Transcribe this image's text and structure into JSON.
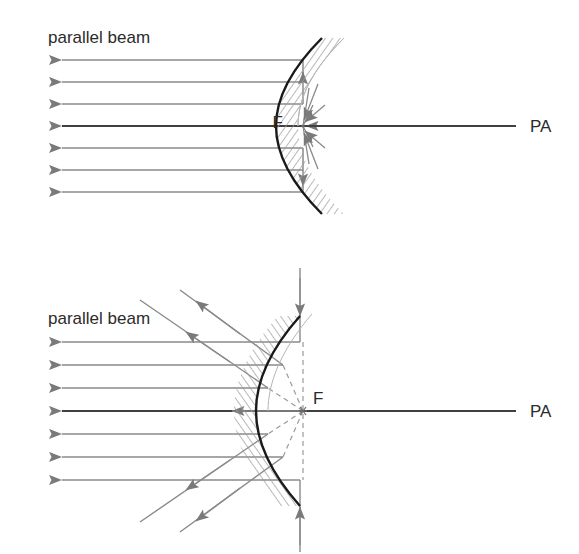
{
  "figure": {
    "background_color": "#ffffff",
    "width": 579,
    "height": 554
  },
  "colors": {
    "ray": "#8a8a8a",
    "arrowhead": "#7a7a7a",
    "axis": "#404040",
    "mirror": "#1a1a1a",
    "hatch": "#9a9a9a",
    "dashed": "#9a9a9a",
    "text": "#2b2b2b"
  },
  "diagrams": [
    {
      "id": "concave-mirror",
      "mirror_type": "concave",
      "beam_label": "parallel beam",
      "focus_label": "F",
      "axis_label": "PA",
      "focus_type": "real",
      "ray_count": 7,
      "ray_y_positions": [
        60,
        82,
        104,
        126,
        148,
        170,
        192
      ],
      "axis_y": 126,
      "focus_x": 303,
      "focus_y": 126,
      "vertex_x": 322,
      "beam_label_x": 48,
      "beam_label_y": 43,
      "focus_label_x": 283,
      "focus_label_y": 128,
      "axis_label_x": 530,
      "axis_label_y": 132,
      "axis_x_start": 28,
      "axis_x_end": 516,
      "ray_x_start": 62,
      "ray_x_end": 303,
      "hatch_side": "right",
      "description": "Parallel rays travelling leftward strike a concave mirror and converge on the real focal point F in front of the mirror."
    },
    {
      "id": "convex-mirror",
      "mirror_type": "convex",
      "beam_label": "parallel beam",
      "focus_label": "F",
      "axis_label": "PA",
      "focus_type": "virtual",
      "ray_count": 7,
      "ray_y_positions": [
        342,
        365,
        388,
        411,
        434,
        457,
        480
      ],
      "axis_y": 411,
      "focus_x": 303,
      "focus_y": 411,
      "vertex_x": 262,
      "beam_label_x": 48,
      "beam_label_y": 324,
      "focus_label_x": 313,
      "focus_label_y": 404,
      "axis_label_x": 530,
      "axis_label_y": 417,
      "axis_x_start": 28,
      "axis_x_end": 516,
      "ray_x_start": 62,
      "hatch_side": "left",
      "description": "Parallel rays travelling leftward strike a convex mirror and diverge; their backward extensions (dashed) meet at the virtual focus F behind the mirror."
    }
  ]
}
